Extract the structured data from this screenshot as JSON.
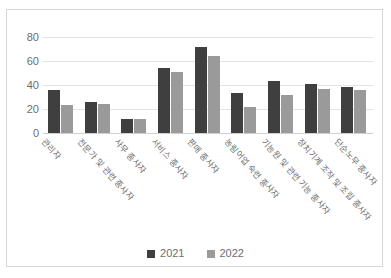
{
  "chart_data": {
    "type": "bar",
    "title": "",
    "subtitle": "",
    "xlabel": "",
    "ylabel": "",
    "ylim": [
      0,
      80
    ],
    "yticks": [
      0,
      20,
      40,
      60,
      80
    ],
    "grid": true,
    "legend_position": "bottom",
    "categories": [
      "관리자",
      "전문가 및 관련 종사자",
      "사무 종사자",
      "서비스 종사자",
      "판매 종사자",
      "농림어업 숙련 종사자",
      "기능원 및 관련 기능 종사자",
      "장치기계 조작 및 조립 종사자",
      "단순노무 종사자"
    ],
    "series": [
      {
        "name": "2021",
        "color": "#3f3f3f",
        "values": [
          36,
          25.5,
          12,
          54.5,
          71.5,
          33,
          43.5,
          40.5,
          38.5
        ]
      },
      {
        "name": "2022",
        "color": "#9a9a9a",
        "values": [
          23,
          24,
          11.5,
          51,
          64,
          21.5,
          32,
          37,
          36
        ]
      }
    ]
  },
  "legend": {
    "items": [
      {
        "label": "2021",
        "color": "#3f3f3f"
      },
      {
        "label": "2022",
        "color": "#9a9a9a"
      }
    ]
  },
  "colors": {
    "series_2021": "#3f3f3f",
    "series_2022": "#9a9a9a",
    "gridline": "#e3e3e3",
    "frame": "#d6d6d6",
    "tick_text": "#6d6d6d"
  }
}
